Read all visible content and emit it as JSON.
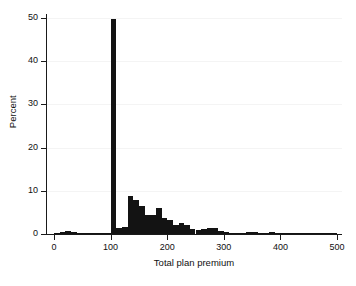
{
  "chart_data": {
    "type": "bar",
    "title": "",
    "subtitle": "",
    "xlabel": "Total plan premium",
    "ylabel": "Percent",
    "xlim": [
      0,
      500
    ],
    "ylim": [
      0,
      50
    ],
    "xticks": [
      0,
      100,
      200,
      300,
      400,
      500
    ],
    "xtick_labels": [
      "0",
      "100",
      "200",
      "300",
      "400",
      "500"
    ],
    "yticks": [
      0,
      10,
      20,
      30,
      40,
      50
    ],
    "ytick_labels": [
      "0",
      "10",
      "20",
      "30",
      "40",
      "50"
    ],
    "grid": false,
    "legend": "none",
    "bar_color": "#131313",
    "bin_width": 10,
    "categories": [
      "0-10",
      "10-20",
      "20-30",
      "30-40",
      "40-50",
      "50-60",
      "60-70",
      "70-80",
      "80-90",
      "90-100",
      "100-110",
      "110-120",
      "120-130",
      "130-140",
      "140-150",
      "150-160",
      "160-170",
      "170-180",
      "180-190",
      "190-200",
      "200-210",
      "210-220",
      "220-230",
      "230-240",
      "240-250",
      "250-260",
      "260-270",
      "270-280",
      "280-290",
      "290-300",
      "300-310",
      "310-320",
      "320-330",
      "330-340",
      "340-350",
      "350-360",
      "360-370",
      "370-380",
      "380-390",
      "390-400",
      "400-410",
      "410-420",
      "420-430",
      "430-440",
      "440-450",
      "450-460",
      "460-470",
      "470-480",
      "480-490",
      "490-500"
    ],
    "x": [
      5,
      15,
      25,
      35,
      45,
      55,
      65,
      75,
      85,
      95,
      105,
      115,
      125,
      135,
      145,
      155,
      165,
      175,
      185,
      195,
      205,
      215,
      225,
      235,
      245,
      255,
      265,
      275,
      285,
      295,
      305,
      315,
      325,
      335,
      345,
      355,
      365,
      375,
      385,
      395,
      405,
      415,
      425,
      435,
      445,
      455,
      465,
      475,
      485,
      495
    ],
    "values": [
      0.1,
      0.5,
      0.6,
      0.4,
      0.3,
      0.2,
      0.2,
      0.15,
      0.1,
      0.1,
      49.8,
      1.5,
      1.6,
      8.8,
      7.8,
      6.5,
      4.5,
      4.4,
      6.0,
      3.6,
      3.3,
      2.0,
      2.6,
      2.0,
      1.2,
      1.0,
      1.2,
      1.5,
      1.5,
      0.7,
      0.4,
      0.3,
      0.2,
      0.2,
      0.4,
      0.5,
      0.3,
      0.3,
      0.4,
      0.2,
      0.15,
      0.1,
      0.05,
      0.05,
      0.05,
      0.05,
      0.05,
      0.05,
      0.35,
      0.1
    ],
    "peak": {
      "bin": "100-110",
      "value": 49.8
    }
  }
}
